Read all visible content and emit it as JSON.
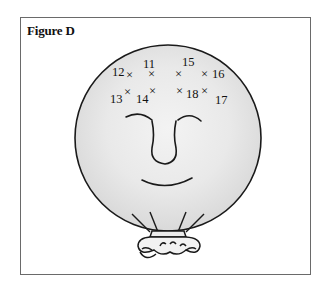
{
  "figure": {
    "title": "Figure D",
    "colors": {
      "frame": "#6a6a6a",
      "outline": "#1a1a1a",
      "balloon_fill": "#e6e6e6",
      "balloon_highlight": "#f4f4f4"
    },
    "points": [
      {
        "label": "11",
        "mark_x": 152,
        "mark_y": 74,
        "label_x": 143,
        "label_y": 68
      },
      {
        "label": "12",
        "mark_x": 130,
        "mark_y": 74,
        "label_x": 112,
        "label_y": 76
      },
      {
        "label": "13",
        "mark_x": 127,
        "mark_y": 92,
        "label_x": 110,
        "label_y": 103
      },
      {
        "label": "14",
        "mark_x": 152,
        "mark_y": 91,
        "label_x": 136,
        "label_y": 103
      },
      {
        "label": "15",
        "mark_x": 179,
        "mark_y": 74,
        "label_x": 182,
        "label_y": 66
      },
      {
        "label": "16",
        "mark_x": 206,
        "mark_y": 74,
        "label_x": 212,
        "label_y": 78
      },
      {
        "label": "17",
        "mark_x": 205,
        "mark_y": 91,
        "label_x": 215,
        "label_y": 104
      },
      {
        "label": "18",
        "mark_x": 180,
        "mark_y": 91,
        "label_x": 186,
        "label_y": 98
      }
    ]
  }
}
